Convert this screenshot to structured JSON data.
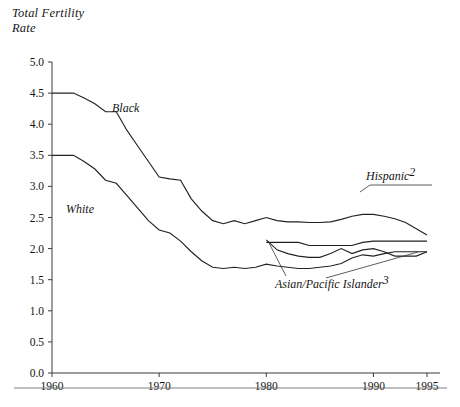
{
  "chart_data": {
    "type": "line",
    "title_line1": "Total Fertility",
    "title_line2": "Rate",
    "xlabel": "",
    "ylabel": "Total Fertility Rate",
    "xlim": [
      1960,
      1995
    ],
    "ylim": [
      0.0,
      5.0
    ],
    "grid": false,
    "legend_position": "inline-labels",
    "ytick_labels": [
      "0.0",
      "0.5",
      "1.0",
      "1.5",
      "2.0",
      "2.5",
      "3.0",
      "3.5",
      "4.0",
      "4.5",
      "5.0"
    ],
    "ytick_values": [
      0.0,
      0.5,
      1.0,
      1.5,
      2.0,
      2.5,
      3.0,
      3.5,
      4.0,
      4.5,
      5.0
    ],
    "xtick_labels": [
      "1960",
      "1970",
      "1980",
      "1990",
      "1995"
    ],
    "xtick_values": [
      1960,
      1970,
      1980,
      1990,
      1995
    ],
    "series": [
      {
        "name": "Black",
        "label": "Black",
        "superscript": "",
        "x": [
          1960,
          1961,
          1962,
          1963,
          1964,
          1965,
          1966,
          1967,
          1968,
          1969,
          1970,
          1971,
          1972,
          1973,
          1974,
          1975,
          1976,
          1977,
          1978,
          1979,
          1980,
          1981,
          1982,
          1983,
          1984,
          1985,
          1986,
          1987,
          1988,
          1989,
          1990,
          1991,
          1992,
          1993,
          1994,
          1995
        ],
        "values": [
          4.5,
          4.5,
          4.5,
          4.42,
          4.33,
          4.2,
          4.2,
          3.9,
          3.65,
          3.4,
          3.15,
          3.12,
          3.1,
          2.8,
          2.6,
          2.45,
          2.4,
          2.45,
          2.4,
          2.45,
          2.5,
          2.45,
          2.43,
          2.43,
          2.42,
          2.42,
          2.43,
          2.47,
          2.52,
          2.55,
          2.55,
          2.52,
          2.48,
          2.42,
          2.32,
          2.22
        ]
      },
      {
        "name": "White",
        "label": "White",
        "superscript": "",
        "x": [
          1960,
          1961,
          1962,
          1963,
          1964,
          1965,
          1966,
          1967,
          1968,
          1969,
          1970,
          1971,
          1972,
          1973,
          1974,
          1975,
          1976,
          1977,
          1978,
          1979,
          1980,
          1981,
          1982,
          1983,
          1984,
          1985,
          1986,
          1987,
          1988,
          1989,
          1990,
          1991,
          1992,
          1993,
          1994,
          1995
        ],
        "values": [
          3.5,
          3.5,
          3.5,
          3.4,
          3.28,
          3.1,
          3.05,
          2.85,
          2.65,
          2.45,
          2.3,
          2.25,
          2.12,
          1.95,
          1.8,
          1.7,
          1.68,
          1.7,
          1.68,
          1.7,
          1.75,
          1.72,
          1.7,
          1.68,
          1.68,
          1.7,
          1.72,
          1.76,
          1.85,
          1.9,
          1.88,
          1.92,
          1.95,
          1.95,
          1.95,
          1.95
        ]
      },
      {
        "name": "Hispanic",
        "label": "Hispanic",
        "superscript": "2",
        "x": [
          1980,
          1981,
          1982,
          1983,
          1984,
          1985,
          1986,
          1987,
          1988,
          1989,
          1990,
          1991,
          1992,
          1993,
          1994,
          1995
        ],
        "values": [
          2.1,
          2.1,
          2.1,
          2.1,
          2.05,
          2.05,
          2.05,
          2.05,
          2.05,
          2.1,
          2.12,
          2.12,
          2.12,
          2.12,
          2.12,
          2.12
        ]
      },
      {
        "name": "Asian/Pacific Islander",
        "label": "Asian/Pacific Islander",
        "superscript": "3",
        "x": [
          1980,
          1981,
          1982,
          1983,
          1984,
          1985,
          1986,
          1987,
          1988,
          1989,
          1990,
          1991,
          1992,
          1993,
          1994,
          1995
        ],
        "values": [
          2.14,
          1.98,
          1.92,
          1.88,
          1.86,
          1.86,
          1.92,
          2.0,
          1.92,
          1.98,
          2.0,
          1.95,
          1.88,
          1.88,
          1.88,
          1.95
        ]
      }
    ],
    "annotations": [
      {
        "name": "black-label",
        "text": "Black",
        "x": 1970,
        "y": 4.18
      },
      {
        "name": "white-label",
        "text": "White",
        "x": 1962,
        "y": 2.55
      },
      {
        "name": "hispanic-label",
        "text": "Hispanic",
        "superscript": "2",
        "x": 1990,
        "y": 2.95
      },
      {
        "name": "asian-pacific-islander-label",
        "text": "Asian/Pacific Islander",
        "superscript": "3",
        "x": 1982,
        "y": 1.28
      }
    ]
  }
}
